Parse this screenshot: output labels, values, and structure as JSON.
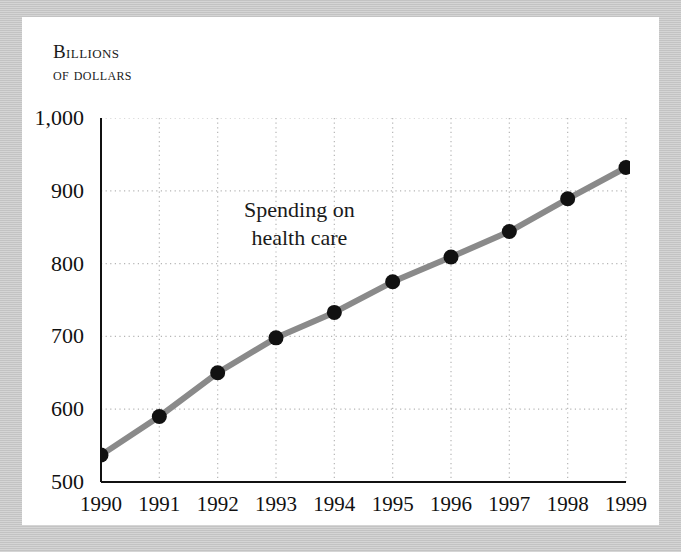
{
  "figure": {
    "frame_color": "#c9c9c9",
    "card_color": "#ffffff"
  },
  "axis_title": {
    "line1": "Billions",
    "line2": "of dollars"
  },
  "annotation": {
    "line1": "Spending on",
    "line2": "health care"
  },
  "chart_data": {
    "type": "line",
    "title": "",
    "subtitle": "",
    "xlabel": "",
    "ylabel": "Billions of dollars",
    "categories": [
      "1990",
      "1991",
      "1992",
      "1993",
      "1994",
      "1995",
      "1996",
      "1997",
      "1998",
      "1999"
    ],
    "x": [
      1990,
      1991,
      1992,
      1993,
      1994,
      1995,
      1996,
      1997,
      1998,
      1999
    ],
    "values": [
      537,
      590,
      650,
      698,
      733,
      775,
      809,
      844,
      889,
      932
    ],
    "series": [
      {
        "name": "Spending on health care",
        "values": [
          537,
          590,
          650,
          698,
          733,
          775,
          809,
          844,
          889,
          932
        ],
        "line_color": "#8a8a8a",
        "marker_color": "#111111"
      }
    ],
    "ylim": [
      500,
      1000
    ],
    "yticks": [
      500,
      600,
      700,
      800,
      900,
      1000
    ],
    "ytick_labels": [
      "500",
      "600",
      "700",
      "800",
      "900",
      "1,000"
    ],
    "xlim": [
      1990,
      1999
    ],
    "xtick_labels": [
      "1990",
      "1991",
      "1992",
      "1993",
      "1994",
      "1995",
      "1996",
      "1997",
      "1998",
      "1999"
    ],
    "grid": true,
    "grid_style": "dotted",
    "grid_color": "#b5b5b5",
    "legend": "none",
    "annotations": [
      {
        "text": "Spending on health care",
        "x": 1993.4,
        "y": 855
      }
    ]
  }
}
